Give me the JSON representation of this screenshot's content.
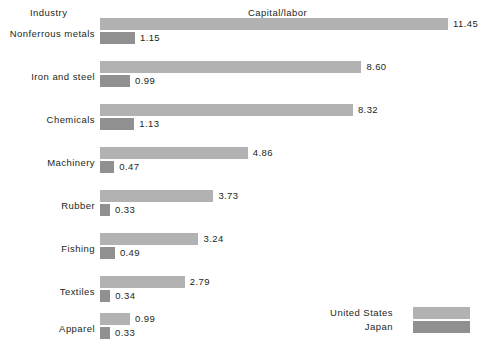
{
  "headers": {
    "industry": "Industry",
    "metric": "Capital/labor"
  },
  "legend": {
    "items": [
      {
        "label": "United  States",
        "series": "United States",
        "color": "#b2b2b2"
      },
      {
        "label": "Japan",
        "series": "Japan",
        "color": "#909090"
      }
    ]
  },
  "colors": {
    "united_states": "#b2b2b2",
    "japan": "#909090",
    "text": "#231f20",
    "background": "#ffffff"
  },
  "chart_data": {
    "type": "bar",
    "orientation": "horizontal",
    "title": "",
    "subtitle": "",
    "xlabel": "Capital/labor",
    "ylabel": "Industry",
    "grid": false,
    "legend_position": "bottom-right",
    "xlim": [
      0,
      11.45
    ],
    "categories": [
      "Nonferrous metals",
      "Iron  and  steel",
      "Chemicals",
      "Machinery",
      "Rubber",
      "Fishing",
      "Textiles",
      "Apparel"
    ],
    "series": [
      {
        "name": "United States",
        "color": "#b2b2b2",
        "values": [
          11.45,
          8.6,
          8.32,
          4.86,
          3.73,
          3.24,
          2.79,
          0.99
        ],
        "labels": [
          "11.45",
          "8.60",
          "8.32",
          "4.86",
          "3.73",
          "3.24",
          "2.79",
          "0.99"
        ]
      },
      {
        "name": "Japan",
        "color": "#909090",
        "values": [
          1.15,
          0.99,
          1.13,
          0.47,
          0.33,
          0.49,
          0.34,
          0.33
        ],
        "labels": [
          "1.15",
          "0.99",
          "1.13",
          "0.47",
          "0.33",
          "0.49",
          "0.34",
          "0.33"
        ]
      }
    ]
  },
  "layout": {
    "bar_origin_x": 100,
    "px_per_unit": 30.4,
    "bar_height": 12,
    "group_top": [
      18,
      61,
      104,
      147,
      190,
      233,
      276,
      313
    ]
  }
}
